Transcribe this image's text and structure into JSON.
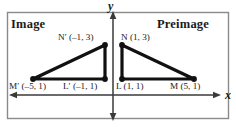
{
  "figure": {
    "panels": {
      "left_title": "Image",
      "right_title": "Preimage"
    },
    "axes": {
      "x_label": "x",
      "y_label": "y"
    },
    "points": [
      {
        "name": "N'",
        "letter": "N′",
        "coords": "(–1, 3)",
        "label": "N′ (–1, 3)",
        "x": -1,
        "y": 3,
        "group": "image"
      },
      {
        "name": "M'",
        "letter": "M′",
        "coords": "(–5, 1)",
        "label": "M′ (–5, 1)",
        "x": -5,
        "y": 1,
        "group": "image"
      },
      {
        "name": "L'",
        "letter": "L′",
        "coords": "(–1, 1)",
        "label": "L′ (–1, 1)",
        "x": -1,
        "y": 1,
        "group": "image"
      },
      {
        "name": "N",
        "letter": "N",
        "coords": "(1, 3)",
        "label": "N (1, 3)",
        "x": 1,
        "y": 3,
        "group": "preimage"
      },
      {
        "name": "L",
        "letter": "L",
        "coords": "(1, 1)",
        "label": "L (1, 1)",
        "x": 1,
        "y": 1,
        "group": "preimage"
      },
      {
        "name": "M",
        "letter": "M",
        "coords": "(5, 1)",
        "label": "M (5, 1)",
        "x": 5,
        "y": 1,
        "group": "preimage"
      }
    ],
    "colors": {
      "line": "#111111",
      "axis": "#3a3a3a",
      "border": "#8a8a8a",
      "background": "#ffffff"
    }
  }
}
